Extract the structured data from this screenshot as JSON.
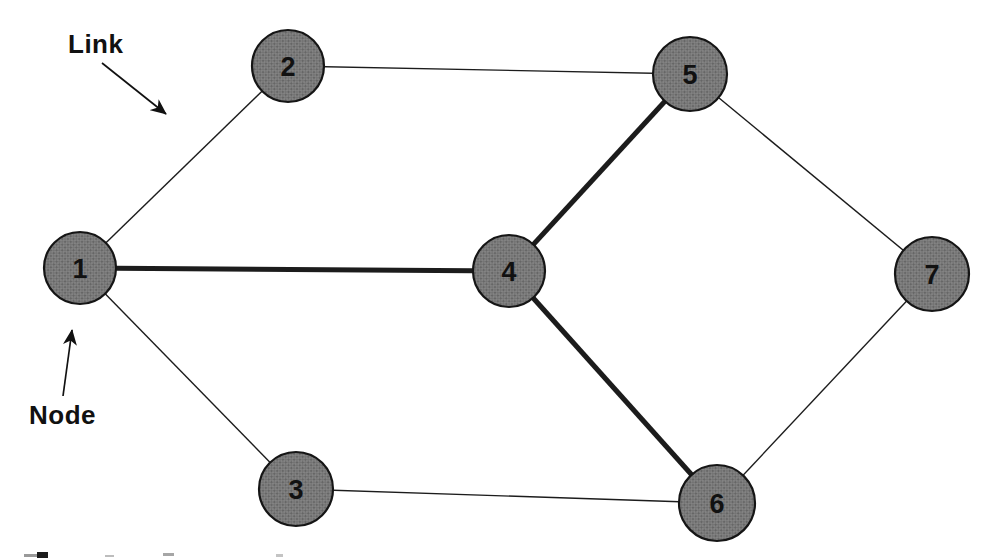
{
  "figure": {
    "background": "#ffffff",
    "node_fill_base": "#838383",
    "node_stipple_dark": "#5c5c5c",
    "node_stipple_mid": "#6d6d6d",
    "node_stroke": "#151515",
    "edge_color": "#1c1c1c",
    "label_color": "#111111",
    "edge_thin_width": 1.4,
    "edge_thick_width": 5,
    "node_stroke_width": 2.2
  },
  "chart_data": {
    "type": "diagram",
    "subtype": "undirected-network-graph",
    "node_count": 7,
    "edge_count": 9,
    "thick_edges": [
      [
        "1",
        "4"
      ],
      [
        "4",
        "5"
      ],
      [
        "4",
        "6"
      ]
    ],
    "thin_edges": [
      [
        "1",
        "2"
      ],
      [
        "1",
        "3"
      ],
      [
        "2",
        "5"
      ],
      [
        "3",
        "6"
      ],
      [
        "5",
        "7"
      ],
      [
        "6",
        "7"
      ]
    ]
  },
  "graph": {
    "nodes": [
      {
        "id": "1",
        "label": "1",
        "x": 80,
        "y": 268,
        "r": 36
      },
      {
        "id": "2",
        "label": "2",
        "x": 288,
        "y": 66,
        "r": 36
      },
      {
        "id": "3",
        "label": "3",
        "x": 296,
        "y": 489,
        "r": 37
      },
      {
        "id": "4",
        "label": "4",
        "x": 509,
        "y": 271,
        "r": 36
      },
      {
        "id": "5",
        "label": "5",
        "x": 690,
        "y": 74,
        "r": 37
      },
      {
        "id": "6",
        "label": "6",
        "x": 717,
        "y": 503,
        "r": 38
      },
      {
        "id": "7",
        "label": "7",
        "x": 932,
        "y": 274,
        "r": 37
      }
    ],
    "edges": [
      {
        "from": "1",
        "to": "2",
        "weight": "thin"
      },
      {
        "from": "1",
        "to": "3",
        "weight": "thin"
      },
      {
        "from": "1",
        "to": "4",
        "weight": "thick"
      },
      {
        "from": "2",
        "to": "5",
        "weight": "thin"
      },
      {
        "from": "4",
        "to": "5",
        "weight": "thick"
      },
      {
        "from": "4",
        "to": "6",
        "weight": "thick"
      },
      {
        "from": "3",
        "to": "6",
        "weight": "thin"
      },
      {
        "from": "5",
        "to": "7",
        "weight": "thin"
      },
      {
        "from": "6",
        "to": "7",
        "weight": "thin"
      }
    ]
  },
  "annotations": {
    "link_label": {
      "text": "Link",
      "x": 68,
      "y": 53,
      "arrow": {
        "x1": 102,
        "y1": 63,
        "x2": 166,
        "y2": 114
      }
    },
    "node_label": {
      "text": "Node",
      "x": 29,
      "y": 424,
      "arrow": {
        "x1": 63,
        "y1": 396,
        "x2": 72,
        "y2": 330
      }
    }
  },
  "caption_fragments": [
    {
      "x": 24,
      "y": 554,
      "w": 13,
      "h": 3,
      "color": "#9a9a9a"
    },
    {
      "x": 37,
      "y": 552,
      "w": 11,
      "h": 6,
      "color": "#1c1c1c"
    },
    {
      "x": 105,
      "y": 555,
      "w": 9,
      "h": 2,
      "color": "#bdbdbd"
    },
    {
      "x": 163,
      "y": 553,
      "w": 11,
      "h": 3,
      "color": "#a6a6a6"
    },
    {
      "x": 276,
      "y": 554,
      "w": 7,
      "h": 3,
      "color": "#c4c4c4"
    }
  ]
}
